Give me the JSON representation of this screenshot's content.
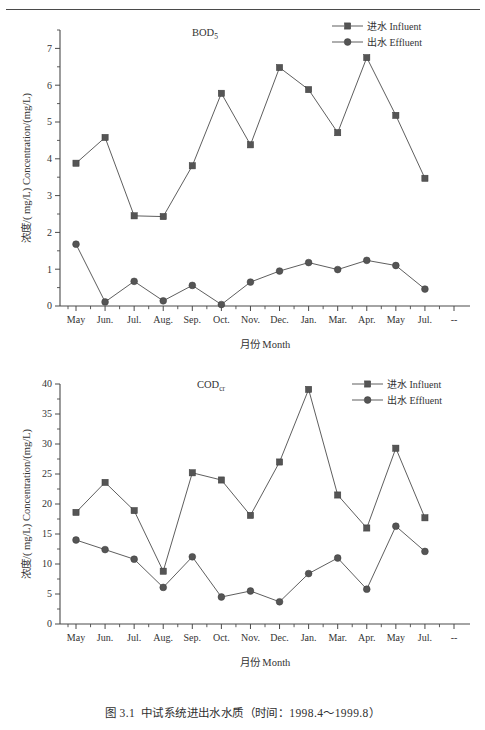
{
  "page": {
    "caption_number": "图 3.1",
    "caption_text": "中试系统进出水水质（时间：1998.4～1999.8）"
  },
  "common": {
    "xlabel": "月份 Month",
    "ylabel": "浓度/( mg/L) Concentration/(mg/L)",
    "legend": [
      {
        "key": "influent",
        "label": "进水 Influent",
        "marker": "square",
        "color": "#555555"
      },
      {
        "key": "effluent",
        "label": "出水 Effluent",
        "marker": "circle",
        "color": "#555555"
      }
    ],
    "categories": [
      "May",
      "Jun.",
      "Jul.",
      "Aug.",
      "Sep.",
      "Oct.",
      "Nov.",
      "Dec.",
      "Jan.",
      "Mar.",
      "Apr.",
      "May",
      "Jul.",
      "--"
    ]
  },
  "chart_data": [
    {
      "id": "bod5",
      "type": "line",
      "title": "BOD",
      "title_sub": "5",
      "xlabel": "月份 Month",
      "ylabel": "浓度/( mg/L) Concentration/(mg/L)",
      "categories": [
        "May",
        "Jun.",
        "Jul.",
        "Aug.",
        "Sep.",
        "Oct.",
        "Nov.",
        "Dec.",
        "Jan.",
        "Mar.",
        "Apr.",
        "May",
        "Jul.",
        "--"
      ],
      "ylim": [
        0,
        7.5
      ],
      "yticks": [
        0,
        1,
        2,
        3,
        4,
        5,
        6,
        7
      ],
      "ytick_labels": [
        "0",
        "1",
        "2",
        "3",
        "4",
        "5",
        "6",
        "7"
      ],
      "minor_tick_step": 0.5,
      "grid": false,
      "legend_position": "top-right",
      "series": [
        {
          "name": "进水 Influent",
          "marker": "square",
          "color": "#555555",
          "values": [
            3.88,
            4.58,
            2.45,
            2.43,
            3.81,
            5.78,
            4.38,
            6.48,
            5.88,
            4.71,
            6.75,
            5.18,
            3.47,
            null
          ]
        },
        {
          "name": "出水 Effluent",
          "marker": "circle",
          "color": "#555555",
          "values": [
            1.68,
            0.11,
            0.67,
            0.14,
            0.56,
            0.04,
            0.65,
            0.95,
            1.18,
            0.99,
            1.24,
            1.1,
            0.46,
            null
          ]
        }
      ]
    },
    {
      "id": "codcr",
      "type": "line",
      "title": "COD",
      "title_sub": "cr",
      "xlabel": "月份 Month",
      "ylabel": "浓度/( mg/L) Concentration/(mg/L)",
      "categories": [
        "May",
        "Jun.",
        "Jul.",
        "Aug.",
        "Sep.",
        "Oct.",
        "Nov.",
        "Dec.",
        "Jan.",
        "Mar.",
        "Apr.",
        "May",
        "Jul.",
        "--"
      ],
      "ylim": [
        0,
        40
      ],
      "yticks": [
        0,
        5,
        10,
        15,
        20,
        25,
        30,
        35,
        40
      ],
      "ytick_labels": [
        "0",
        "5",
        "10",
        "15",
        "20",
        "25",
        "30",
        "35",
        "40"
      ],
      "minor_tick_step": 2.5,
      "grid": false,
      "legend_position": "top-right",
      "series": [
        {
          "name": "进水 Influent",
          "marker": "square",
          "color": "#555555",
          "values": [
            18.6,
            23.6,
            18.9,
            8.8,
            25.2,
            24.0,
            18.1,
            27.0,
            39.1,
            21.5,
            16.0,
            29.3,
            17.7,
            null
          ]
        },
        {
          "name": "出水 Effluent",
          "marker": "circle",
          "color": "#555555",
          "values": [
            14.0,
            12.4,
            10.8,
            6.1,
            11.2,
            4.5,
            5.5,
            3.7,
            8.4,
            11.0,
            5.8,
            16.3,
            12.1,
            null
          ]
        }
      ]
    }
  ]
}
